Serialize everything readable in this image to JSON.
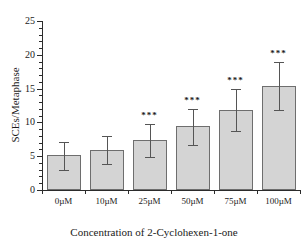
{
  "chart_data": {
    "type": "bar",
    "title": "",
    "xlabel": "Concentration of 2-Cyclohexen-1-one",
    "ylabel": "SCEs/Metaphase",
    "categories": [
      "0µM",
      "10µM",
      "25µM",
      "50µM",
      "75µM",
      "100µM"
    ],
    "values": [
      5.2,
      5.9,
      7.4,
      9.4,
      11.9,
      15.4
    ],
    "error_upper": [
      1.9,
      2.1,
      2.3,
      2.6,
      3.0,
      3.6
    ],
    "error_lower": [
      2.3,
      2.1,
      2.5,
      2.7,
      3.1,
      3.5
    ],
    "error_bar_tops": [
      7.1,
      8.0,
      9.7,
      12.0,
      14.9,
      19.0
    ],
    "error_bar_bottoms": [
      2.9,
      3.8,
      4.9,
      6.7,
      8.8,
      11.9
    ],
    "significance": [
      "",
      "",
      "***",
      "***",
      "***",
      "***"
    ],
    "ylim": [
      0,
      25
    ],
    "y_major_ticks": [
      0,
      5,
      10,
      15,
      20,
      25
    ],
    "y_tick_labels": [
      "0",
      "5",
      "10",
      "15",
      "20",
      "25"
    ],
    "y_minor_tick_step": 1,
    "grid": false,
    "legend": "none",
    "bar_color": "#d4d4d4",
    "bar_edge_color": "#6e6e6e",
    "error_bar_color": "#555555",
    "axis_color": "#2b2b2b"
  }
}
